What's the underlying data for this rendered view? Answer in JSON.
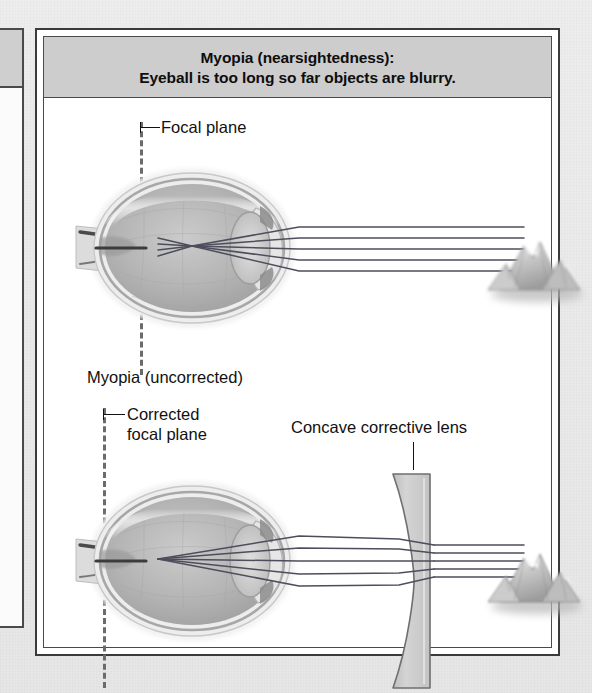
{
  "figure": {
    "title_line1": "Myopia (nearsightedness):",
    "title_line2": "Eyeball is too long so far objects are blurry.",
    "title_bar_color": "#cdcdcd",
    "card_background": "#ffffff",
    "border_color": "#3a3a3a",
    "page_background": "#e8e8e8"
  },
  "labels": {
    "focal_plane": "Focal plane",
    "myopia_uncorrected": "Myopia (uncorrected)",
    "corrected_focal_plane_line1": "Corrected",
    "corrected_focal_plane_line2": "focal plane",
    "concave_lens": "Concave corrective lens"
  },
  "diagram_top": {
    "name": "uncorrected-myopic-eye",
    "focal_plane_style": "dashed-vertical",
    "focal_plane_color": "#6b6b6b",
    "ray_count": 5,
    "ray_color": "#4a4a5a",
    "object": "distant-mountain",
    "description": "Parallel light rays from a distant object converge in front of the retina"
  },
  "diagram_bottom": {
    "name": "corrected-myopic-eye",
    "focal_plane_style": "dashed-vertical",
    "focal_plane_color": "#6b6b6b",
    "ray_count": 5,
    "ray_color": "#4a4a5a",
    "object": "distant-mountain",
    "lens": "concave-corrective-lens",
    "lens_fill": "#c9c9c9",
    "description": "A concave lens diverges the rays so they focus on the retina"
  },
  "eye_anatomy": {
    "sclera_color": "#e3e3e3",
    "vitreous_color": "#b9b9b9",
    "lens_color": "#cfcfcf",
    "optic_nerve_color": "#9a9a9a"
  },
  "left_panel_stub": {
    "visible": true,
    "header_color": "#cfcfcf"
  }
}
